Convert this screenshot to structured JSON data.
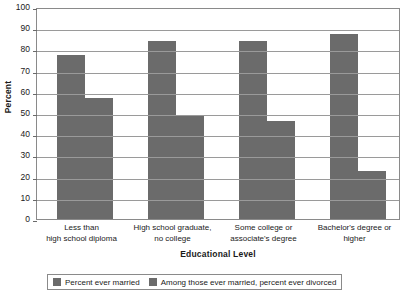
{
  "chart_data": {
    "type": "bar",
    "title": "",
    "subtitle": "",
    "xlabel": "Educational Level",
    "ylabel": "Percent",
    "ylim": [
      0,
      100
    ],
    "ytick_step": 10,
    "yticks": [
      0,
      10,
      20,
      30,
      40,
      50,
      60,
      70,
      80,
      90,
      100
    ],
    "ytick_labels": [
      "0",
      "10",
      "20",
      "30",
      "40",
      "50",
      "60",
      "70",
      "80",
      "90",
      "100"
    ],
    "grid": true,
    "grid_axis": "y",
    "legend_position": "bottom",
    "categories": [
      "Less than\nhigh school diploma",
      "High school graduate,\nno college",
      "Some college or\nassociate's degree",
      "Bachelor's degree or\nhigher"
    ],
    "category_lines": [
      [
        "Less than",
        "high school diploma"
      ],
      [
        "High school graduate,",
        "no college"
      ],
      [
        "Some college or",
        "associate's degree"
      ],
      [
        "Bachelor's degree or",
        "higher"
      ]
    ],
    "series": [
      {
        "name": "Percent ever married",
        "color": "#6b6b6b",
        "values": [
          77.5,
          84,
          84,
          87.5
        ]
      },
      {
        "name": "Among those ever married, percent ever divorced",
        "color": "#6b6b6b",
        "values": [
          57,
          48.5,
          46,
          22.5
        ]
      }
    ]
  },
  "legend": {
    "items": [
      {
        "label": "Percent ever married",
        "color": "#6b6b6b"
      },
      {
        "label": "Among those ever married, percent ever divorced",
        "color": "#6b6b6b"
      }
    ]
  },
  "colors": {
    "bar": "#6b6b6b",
    "gridline": "#9a9a9a",
    "axis": "#8a8a8a",
    "text": "#1a1a1a",
    "background": "#ffffff"
  }
}
